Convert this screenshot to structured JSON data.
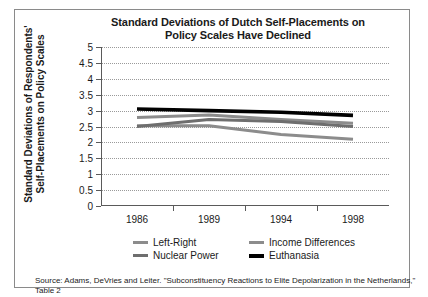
{
  "chart_data": {
    "type": "line",
    "title": "Standard Deviations of Dutch Self-Placements on Policy Scales Have Declined",
    "title_line1": "Standard Deviations of Dutch Self-Placements on",
    "title_line2": "Policy Scales Have Declined",
    "xlabel": "",
    "ylabel": "Standard Deviations of Respondents' Self-Placements on Policy Scales",
    "ylabel_line1": "Standard Deviations of Respondents'",
    "ylabel_line2": "Self-Placements on Policy Scales",
    "x": [
      1986,
      1989,
      1994,
      1998
    ],
    "xtick_labels": [
      "1986",
      "1989",
      "1994",
      "1998"
    ],
    "ytick_labels": [
      "5",
      "4.5",
      "4",
      "3.5",
      "3",
      "2.5",
      "2",
      "1.5",
      "1",
      "0.5",
      "0"
    ],
    "ylim": [
      0,
      5
    ],
    "ytick_step": 0.5,
    "grid": true,
    "legend_position": "bottom",
    "series": [
      {
        "name": "Left-Right",
        "values": [
          2.78,
          2.86,
          2.72,
          2.6
        ],
        "color": "#8c8c8c",
        "width": 3
      },
      {
        "name": "Income Differences",
        "values": [
          2.52,
          2.52,
          2.25,
          2.1
        ],
        "color": "#8c8c8c",
        "width": 3
      },
      {
        "name": "Nuclear Power",
        "values": [
          2.5,
          2.72,
          2.66,
          2.5
        ],
        "color": "#6e6e6e",
        "width": 3
      },
      {
        "name": "Euthanasia",
        "values": [
          3.05,
          3.0,
          2.95,
          2.85
        ],
        "color": "#000000",
        "width": 3.6
      }
    ]
  },
  "source": {
    "line1": "Source: Adams, DeVries and Leiter. \"Subconstituency Reactions to Elite Depolarization in the Netherlands,\"",
    "line2": "Table 2"
  },
  "colors": {
    "frame": "#8a8a8a",
    "axis": "#5a5a5a",
    "grid": "#9a9a9a",
    "accent": "#000000"
  }
}
